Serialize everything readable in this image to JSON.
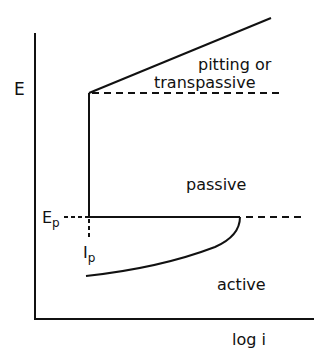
{
  "diagram": {
    "type": "polarization-curve",
    "axes": {
      "y_label": "E",
      "x_label": "log i"
    },
    "regions": {
      "upper": "pitting or",
      "upper_2": "transpassive",
      "middle": "passive",
      "lower": "active"
    },
    "markers": {
      "potential_label": "E",
      "potential_sub": "p",
      "current_label": "I",
      "current_sub": "p"
    },
    "colors": {
      "line": "#111111",
      "background": "#ffffff"
    }
  }
}
